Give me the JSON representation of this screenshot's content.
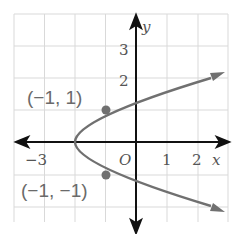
{
  "graph": {
    "equation_implied": "x = y^2 - 2",
    "origin_label": "O",
    "x_axis_label": "x",
    "y_axis_label": "y",
    "x_ticks": [
      {
        "value": -3,
        "label": "−3"
      },
      {
        "value": 1,
        "label": "1"
      },
      {
        "value": 2,
        "label": "2"
      }
    ],
    "y_ticks": [
      {
        "value": 2,
        "label": "2"
      },
      {
        "value": 3,
        "label": "3"
      }
    ],
    "points": [
      {
        "x": -1,
        "y": 1,
        "label": "(−1, 1)"
      },
      {
        "x": -1,
        "y": -1,
        "label": "(−1, −1)"
      }
    ],
    "vertex": {
      "x": -2,
      "y": 0
    },
    "colors": {
      "curve": "#6e6e6e",
      "axis": "#111111",
      "grid": "#d8d8d8",
      "point": "#707070"
    }
  }
}
